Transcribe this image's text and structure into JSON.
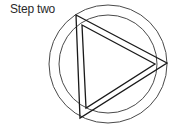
{
  "title": "Step two",
  "diagram": {
    "stroke_color": "#1a1a1a",
    "circle_color": "#4a4a4a",
    "outer_circle": {
      "cx": 108,
      "cy": 64,
      "r": 59
    },
    "inner_circle": {
      "cx": 108,
      "cy": 64,
      "r": 49
    },
    "outer_triangle": [
      [
        76,
        15
      ],
      [
        167,
        63
      ],
      [
        80,
        118
      ]
    ],
    "inner_triangle": [
      [
        82,
        25
      ],
      [
        155,
        64
      ],
      [
        86,
        108
      ]
    ]
  }
}
